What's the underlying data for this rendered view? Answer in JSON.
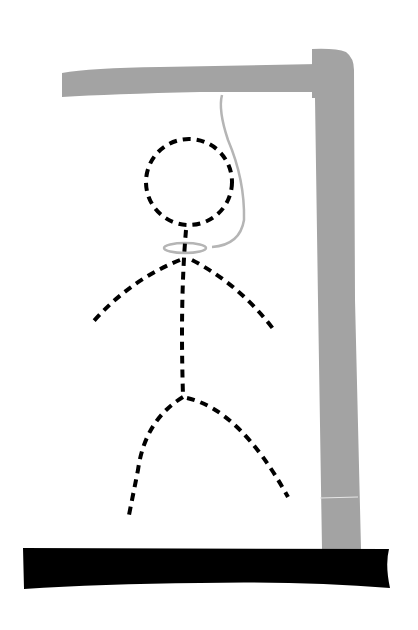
{
  "scene": {
    "subject": "hangman drawing",
    "colors": {
      "background": "#ffffff",
      "gallows": "#a3a3a3",
      "rope": "#b5b5b5",
      "base": "#000000",
      "figure": "#000000"
    },
    "parts": [
      "gallows-beam",
      "gallows-post",
      "base",
      "rope",
      "noose",
      "head",
      "body",
      "left-arm",
      "right-arm",
      "left-leg",
      "right-leg"
    ]
  }
}
